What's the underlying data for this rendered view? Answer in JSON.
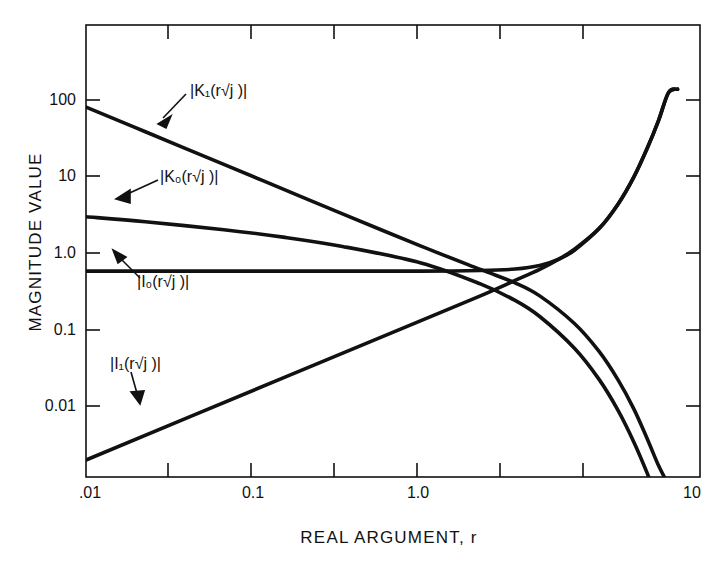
{
  "chart_data": {
    "type": "line",
    "title": "",
    "xlabel": "REAL ARGUMENT, r",
    "ylabel": "MAGNITUDE VALUE",
    "xscale": "log",
    "yscale": "log",
    "xlim": [
      0.01,
      13.0
    ],
    "ylim": [
      0.0031,
      1000
    ],
    "grid": false,
    "legend": "inline-annotations",
    "xticklabels": [
      ".01",
      "0.1",
      "1.0",
      "10"
    ],
    "xtickvalues": [
      0.01,
      0.1,
      1.0,
      10
    ],
    "xminorticks": [
      0.03,
      0.3,
      3.0
    ],
    "yticklabels": [
      "100",
      "10",
      "1.0",
      "0.1",
      "0.01"
    ],
    "ytickvalues": [
      100,
      10,
      1.0,
      0.1,
      0.01
    ],
    "series": [
      {
        "name": "|K1(r sqrt(j))|",
        "label_text": "|K₁(r√j )|",
        "x": [
          0.01,
          0.02,
          0.05,
          0.1,
          0.2,
          0.5,
          1.0,
          1.5,
          2.0,
          3.0,
          4.0,
          5.0,
          6.0,
          7.0,
          8.0,
          8.7,
          9.0
        ],
        "y": [
          100.0,
          50.0,
          20.0,
          10.0,
          5.0,
          2.02,
          1.05,
          0.72,
          0.5,
          0.23,
          0.105,
          0.047,
          0.021,
          0.0092,
          0.0043,
          0.0029,
          0.0024
        ]
      },
      {
        "name": "|K0(r sqrt(j))|",
        "label_text": "|K₀(r√j )|",
        "x": [
          0.01,
          0.02,
          0.05,
          0.1,
          0.2,
          0.5,
          1.0,
          1.5,
          2.0,
          3.0,
          4.0,
          5.0,
          6.0,
          7.0,
          8.0,
          8.7,
          9.0
        ],
        "y": [
          4.6,
          4.0,
          3.2,
          2.6,
          2.0,
          1.26,
          0.7,
          0.44,
          0.28,
          0.115,
          0.048,
          0.02,
          0.0083,
          0.0035,
          0.0015,
          0.00085,
          0.0007
        ]
      },
      {
        "name": "|I0(r sqrt(j))|",
        "label_text": "|I₀(r√j )|",
        "x": [
          0.01,
          0.1,
          0.5,
          1.0,
          1.5,
          2.0,
          2.5,
          3.0,
          4.0,
          5.0,
          6.0,
          7.0,
          8.0,
          9.0,
          10.0
        ],
        "y": [
          1.0,
          1.0,
          1.0,
          1.02,
          1.06,
          1.17,
          1.4,
          1.8,
          3.3,
          6.6,
          14.0,
          31.0,
          68.0,
          150.0,
          165.0
        ]
      },
      {
        "name": "|I1(r sqrt(j))|",
        "label_text": "|I₁(r√j )|",
        "x": [
          0.01,
          0.1,
          0.5,
          1.0,
          1.5,
          2.0,
          2.5,
          3.0,
          4.0,
          5.0,
          6.0,
          7.0,
          8.0,
          9.0,
          10.0
        ],
        "y": [
          0.005,
          0.05,
          0.25,
          0.5,
          0.77,
          1.05,
          1.4,
          1.85,
          3.3,
          6.6,
          14.0,
          31.0,
          68.0,
          150.0,
          165.0
        ]
      }
    ],
    "annotations": [
      {
        "text": "|K₁(r√j )|",
        "points_to_series": "|K1(r sqrt(j))|"
      },
      {
        "text": "|K₀(r√j )|",
        "points_to_series": "|K0(r sqrt(j))|"
      },
      {
        "text": "|I₀(r√j )|",
        "points_to_series": "|I0(r sqrt(j))|"
      },
      {
        "text": "|I₁(r√j )|",
        "points_to_series": "|I1(r sqrt(j))|"
      }
    ]
  },
  "axes": {
    "ylabel": "MAGNITUDE VALUE",
    "xlabel": "REAL ARGUMENT, r",
    "yticks": [
      {
        "label": "100"
      },
      {
        "label": "10"
      },
      {
        "label": "1.0"
      },
      {
        "label": "0.1"
      },
      {
        "label": "0.01"
      }
    ],
    "xticks": [
      {
        "label": ".01"
      },
      {
        "label": "0.1"
      },
      {
        "label": "1.0"
      },
      {
        "label": "10"
      }
    ]
  },
  "labels": {
    "k1": "|K₁(r√j )|",
    "k0": "|K₀(r√j )|",
    "i0": "|I₀(r√j )|",
    "i1": "|I₁(r√j )|"
  },
  "colors": {
    "ink": "#111111",
    "background": "#ffffff"
  }
}
